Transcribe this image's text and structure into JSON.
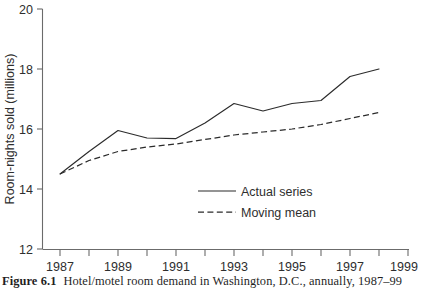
{
  "caption": {
    "label": "Figure 6.1",
    "text": "Hotel/motel room demand in Washington, D.C., annually, 1987–99"
  },
  "chart_data": {
    "type": "line",
    "title": "",
    "subtitle": "",
    "xlabel": "",
    "ylabel": "Room-nights sold (millions)",
    "xlim": [
      1986.4,
      1999.1
    ],
    "ylim": [
      12,
      20
    ],
    "grid": false,
    "legend_position": "inside-center-lower",
    "x_tick_labels": [
      "1987",
      "1989",
      "1991",
      "1993",
      "1995",
      "1997",
      "1999"
    ],
    "x_tick_values": [
      1987,
      1989,
      1991,
      1993,
      1995,
      1997,
      1999
    ],
    "x_minor_tick_values": [
      1988,
      1990,
      1992,
      1994,
      1996,
      1998
    ],
    "y_tick_labels": [
      "12",
      "14",
      "16",
      "18",
      "20"
    ],
    "y_tick_values": [
      12,
      14,
      16,
      18,
      20
    ],
    "x": [
      1987,
      1988,
      1989,
      1990,
      1991,
      1992,
      1993,
      1994,
      1995,
      1996,
      1997,
      1998
    ],
    "series": [
      {
        "name": "Actual series",
        "style": "solid",
        "color": "#2b2b2b",
        "values": [
          14.5,
          15.25,
          15.95,
          15.7,
          15.68,
          16.2,
          16.85,
          16.6,
          16.85,
          16.95,
          17.75,
          18.0
        ]
      },
      {
        "name": "Moving mean",
        "style": "dashed",
        "color": "#2b2b2b",
        "values": [
          14.5,
          14.95,
          15.25,
          15.4,
          15.5,
          15.65,
          15.8,
          15.9,
          16.0,
          16.15,
          16.35,
          16.55
        ]
      }
    ]
  }
}
